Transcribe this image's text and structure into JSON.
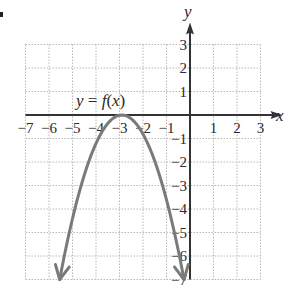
{
  "problem_marker": ".",
  "chart_data": {
    "type": "line",
    "title": "",
    "annotation": "y = f(x)",
    "xlabel": "x",
    "ylabel": "y",
    "xlim": [
      -7,
      3
    ],
    "ylim": [
      -7,
      3
    ],
    "xticks": [
      -7,
      -6,
      -5,
      -4,
      -3,
      -2,
      -1,
      1,
      2,
      3
    ],
    "yticks": [
      3,
      2,
      1,
      -1,
      -2,
      -3,
      -4,
      -5,
      -6,
      -7
    ],
    "grid": true,
    "series": [
      {
        "name": "f(x)",
        "shape": "downward parabola",
        "vertex": [
          -3,
          0
        ],
        "x": [
          -5.6,
          -5,
          -4.5,
          -4,
          -3.5,
          -3,
          -2.5,
          -2,
          -1.5,
          -1,
          -0.35
        ],
        "y": [
          -7,
          -4,
          -2.25,
          -1,
          -0.25,
          0,
          -0.25,
          -1,
          -2.25,
          -4,
          -7
        ],
        "arrows": "both ends",
        "color": "#7a7a7a"
      }
    ]
  },
  "labels": {
    "x_axis": "x",
    "y_axis": "y",
    "function": "y = f(x)",
    "x_ticks": [
      "−7",
      "−6",
      "−5",
      "−4",
      "−3",
      "−2",
      "−1",
      "1",
      "2",
      "3"
    ],
    "y_ticks": [
      "3",
      "2",
      "1",
      "−1",
      "−2",
      "−3",
      "−4",
      "−5",
      "−6",
      "−7"
    ]
  },
  "colors": {
    "axis": "#333333",
    "grid": "#b8b8b8",
    "curve": "#7a7a7a"
  }
}
